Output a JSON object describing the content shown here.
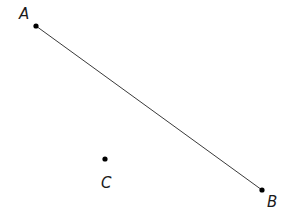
{
  "diagram": {
    "points": [
      {
        "id": "A",
        "label": "A"
      },
      {
        "id": "B",
        "label": "B"
      },
      {
        "id": "C",
        "label": "C"
      }
    ],
    "segments": [
      {
        "from": "A",
        "to": "B"
      }
    ]
  }
}
